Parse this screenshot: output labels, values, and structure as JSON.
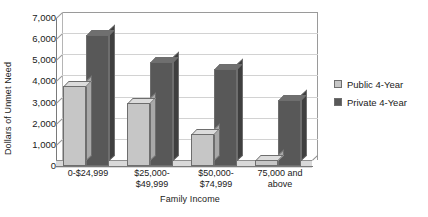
{
  "chart_data": {
    "type": "bar",
    "title": "",
    "xlabel": "Family Income",
    "ylabel": "Dollars of Unmet Need",
    "categories": [
      "0-$24,999",
      "$25,000-\n$49,999",
      "$50,000-\n$74,999",
      "75,000 and\nabove"
    ],
    "series": [
      {
        "name": "Public 4-Year",
        "color": "#c6c6c6",
        "values": [
          3800,
          3000,
          1500,
          300
        ]
      },
      {
        "name": "Private 4-Year",
        "color": "#585858",
        "values": [
          6200,
          4900,
          4600,
          3100
        ]
      }
    ],
    "ylim": [
      0,
      7000
    ],
    "ytick_step": 1000,
    "ytick_labels": [
      "7,000",
      "6,000",
      "5,000",
      "4,000",
      "3,000",
      "2,000",
      "1,000",
      "0"
    ],
    "grid": true,
    "legend_position": "right",
    "style": "3d-column"
  },
  "legend": {
    "items": [
      {
        "label": "Public 4-Year",
        "swatch": "public"
      },
      {
        "label": "Private 4-Year",
        "swatch": "private"
      }
    ]
  }
}
